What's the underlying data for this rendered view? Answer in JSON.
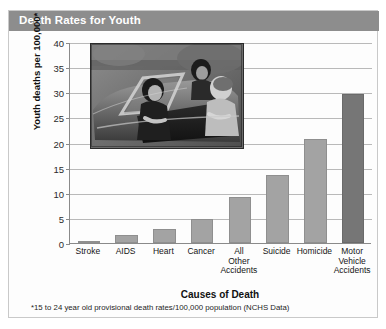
{
  "header": {
    "title": "Death Rates for Youth"
  },
  "footnote": "*15 to 24 year old provisional death rates/100,000 population (NCHS Data)",
  "inset": {
    "name": "photo-teens-in-convertible-car",
    "description": "Black and white photograph of young people riding in an open convertible car"
  },
  "chart_data": {
    "type": "bar",
    "title": "Death Rates for Youth",
    "xlabel": "Causes of Death",
    "ylabel": "Youth deaths per 100,000*",
    "ylim": [
      0,
      40
    ],
    "ytick_step": 5,
    "yticks": [
      0,
      5,
      10,
      15,
      20,
      25,
      30,
      35,
      40
    ],
    "ytick_labels": [
      "0",
      "5",
      "10",
      "15",
      "20",
      "25",
      "30",
      "35",
      "40"
    ],
    "grid": true,
    "legend": false,
    "categories": [
      "Stroke",
      "AIDS",
      "Heart",
      "Cancer",
      "All Other Accidents",
      "Suicide",
      "Homicide",
      "Motor Vehicle Accidents"
    ],
    "values": [
      0.4,
      1.5,
      2.8,
      4.8,
      9.2,
      13.5,
      20.7,
      29.7
    ],
    "bar_colors": [
      "#a3a3a3",
      "#a3a3a3",
      "#a3a3a3",
      "#a3a3a3",
      "#a3a3a3",
      "#a3a3a3",
      "#a3a3a3",
      "#767676"
    ],
    "accent_color": "#767676",
    "bar_color": "#a3a3a3",
    "header_color": "#8d8d8d",
    "grid_color": "#b9b9b9",
    "axis_color": "#8a8a8a"
  }
}
